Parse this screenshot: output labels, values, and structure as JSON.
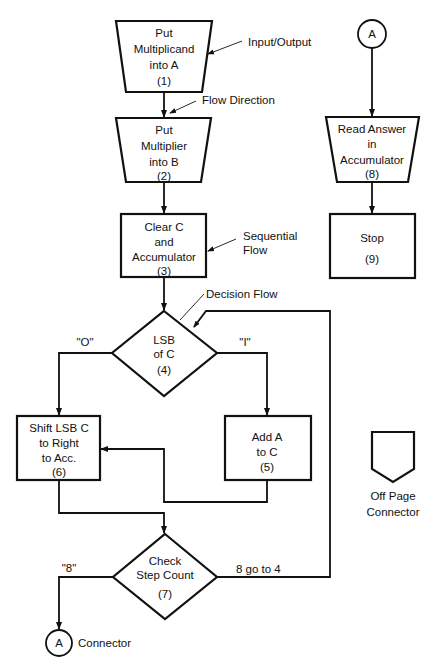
{
  "diagram": {
    "nodes": {
      "n1": {
        "type": "input-output",
        "lines": [
          "Put",
          "Multiplicand",
          "into A",
          "(1)"
        ]
      },
      "n2": {
        "type": "input-output",
        "lines": [
          "Put",
          "Multiplier",
          "into B",
          "(2)"
        ]
      },
      "n3": {
        "type": "process",
        "lines": [
          "Clear C",
          "and",
          "Accumulator",
          "(3)"
        ]
      },
      "n4": {
        "type": "decision",
        "lines": [
          "LSB",
          "of C",
          "(4)"
        ]
      },
      "n5": {
        "type": "process",
        "lines": [
          "Add A",
          "to C",
          "(5)"
        ]
      },
      "n6": {
        "type": "process",
        "lines": [
          "Shift LSB C",
          "to Right",
          "to Acc.",
          "(6)"
        ]
      },
      "n7": {
        "type": "decision",
        "lines": [
          "Check",
          "Step Count",
          "(7)"
        ]
      },
      "n8": {
        "type": "input-output",
        "lines": [
          "Read Answer",
          "in",
          "Accumulator",
          "(8)"
        ]
      },
      "n9": {
        "type": "process",
        "lines": [
          "Stop",
          "(9)"
        ]
      },
      "connA_bottom": {
        "type": "connector",
        "label": "A"
      },
      "connA_top": {
        "type": "connector",
        "label": "A"
      },
      "offpage": {
        "type": "off-page-connector"
      }
    },
    "edge_labels": {
      "zero": "\"O\"",
      "one": "\"I\"",
      "eight": "\"8\"",
      "not_eight": "8 go to 4"
    },
    "annotations": {
      "input_output": "Input/Output",
      "flow_direction": "Flow Direction",
      "sequential_1": "Sequential",
      "sequential_2": "Flow",
      "decision_flow": "Decision Flow",
      "connector": "Connector",
      "offpage_1": "Off Page",
      "offpage_2": "Connector"
    },
    "edges": [
      {
        "from": "n1",
        "to": "n2"
      },
      {
        "from": "n2",
        "to": "n3"
      },
      {
        "from": "n3",
        "to": "n4"
      },
      {
        "from": "n4",
        "to": "n6",
        "label": "\"O\""
      },
      {
        "from": "n4",
        "to": "n5",
        "label": "\"I\""
      },
      {
        "from": "n5",
        "to": "n6"
      },
      {
        "from": "n6",
        "to": "n7"
      },
      {
        "from": "n7",
        "to": "connA_bottom",
        "label": "\"8\""
      },
      {
        "from": "n7",
        "to": "n4",
        "label": "8 go to 4"
      },
      {
        "from": "connA_top",
        "to": "n8"
      },
      {
        "from": "n8",
        "to": "n9"
      }
    ]
  }
}
